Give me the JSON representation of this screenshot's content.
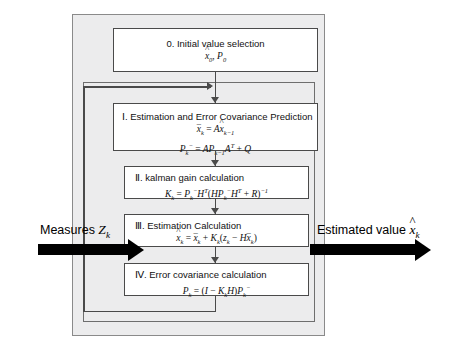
{
  "diagram": {
    "outer_container_label": "kalman-filter-process-container",
    "loop_label": "recursive-loop-frame"
  },
  "io": {
    "input": {
      "text": "Measures ",
      "symbol": "Z",
      "subscript": "k",
      "arrow": "right-arrow"
    },
    "output": {
      "text": "Estimated value ",
      "symbol": "x",
      "symbol_accent": "hat",
      "subscript": "k",
      "arrow": "right-arrow"
    }
  },
  "steps": [
    {
      "id": "step-0",
      "title": "0. Initial value selection",
      "equations": [
        {
          "lhs": "x̂₀, P₀"
        }
      ]
    },
    {
      "id": "step-1",
      "title": "Ⅰ. Estimation and Error Covariance Prediction",
      "equations": [
        {
          "lhs": "x̄ₖ = Ax̂ₖ₋₁"
        },
        {
          "lhs": "Pₖ⁻ = APₖ₋₁Aᵀ + Q"
        }
      ]
    },
    {
      "id": "step-2",
      "title": "Ⅱ. kalman gain calculation",
      "equations": [
        {
          "lhs": "Kₖ = Pₖ⁻Hᵀ(HPₖ⁻Hᵀ + R)⁻¹"
        }
      ]
    },
    {
      "id": "step-3",
      "title": "Ⅲ. Estimation Calculation",
      "equations": [
        {
          "lhs": "x̂ₖ = x̄ₖ + Kₖ(zₖ − Hx̄ₖ)"
        }
      ]
    },
    {
      "id": "step-4",
      "title": "Ⅳ. Error covariance calculation",
      "equations": [
        {
          "lhs": "Pₖ = (I − KₖH)Pₖ⁻"
        }
      ]
    }
  ],
  "colors": {
    "page_background": "#ffffff",
    "container_fill": "#ececed",
    "container_border": "#8a8a8a",
    "loop_border": "#6e6e6e",
    "box_fill": "#ffffff",
    "box_border": "#4a4a4a",
    "connector": "#4a4a4a",
    "io_arrow": "#000000",
    "text": "#111111"
  }
}
